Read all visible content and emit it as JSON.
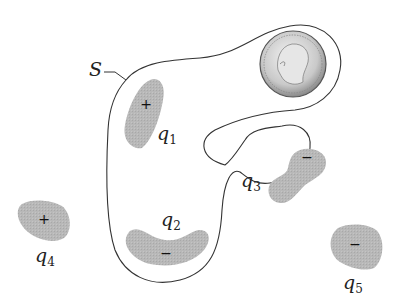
{
  "diagram": {
    "surface_label": "S",
    "colors": {
      "charge_fill": "#b5b5b5",
      "outline": "#333333",
      "background": "#ffffff"
    },
    "charges": [
      {
        "id": "q1",
        "name": "q",
        "subscript": "1",
        "sign": "+",
        "inside_surface": true
      },
      {
        "id": "q2",
        "name": "q",
        "subscript": "2",
        "sign": "−",
        "inside_surface": true
      },
      {
        "id": "q3",
        "name": "q",
        "subscript": "3",
        "sign": "−",
        "inside_surface": false
      },
      {
        "id": "q4",
        "name": "q",
        "subscript": "4",
        "sign": "+",
        "inside_surface": false
      },
      {
        "id": "q5",
        "name": "q",
        "subscript": "5",
        "sign": "−",
        "inside_surface": false
      }
    ],
    "coin": {
      "icon": "quarter-coin-icon",
      "inside_surface": true
    }
  }
}
